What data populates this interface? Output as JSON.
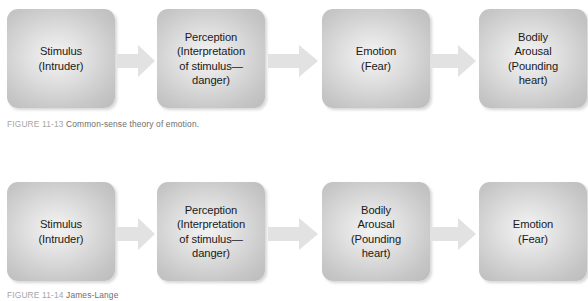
{
  "figures": [
    {
      "id": "common-sense-theory",
      "caption": {
        "tag": "FIGURE 11-13",
        "text": "Common-sense theory of emotion."
      },
      "nodes": [
        {
          "name": "stimulus",
          "label": "Stimulus\n(Intruder)"
        },
        {
          "name": "perception",
          "label": "Perception\n(Interpretation\nof stimulus—\ndanger)"
        },
        {
          "name": "emotion",
          "label": "Emotion\n(Fear)"
        },
        {
          "name": "bodily-arousal",
          "label": "Bodily\nArousal\n(Pounding\nheart)"
        }
      ],
      "arrow_icon": "right-arrow-icon",
      "arrow_count": 3
    },
    {
      "id": "james-lange-theory",
      "caption": {
        "tag": "FIGURE 11-14",
        "text": "James-Lange"
      },
      "nodes": [
        {
          "name": "stimulus",
          "label": "Stimulus\n(Intruder)"
        },
        {
          "name": "perception",
          "label": "Perception\n(Interpretation\nof stimulus—\ndanger)"
        },
        {
          "name": "bodily-arousal",
          "label": "Bodily\nArousal\n(Pounding\nheart)"
        },
        {
          "name": "emotion",
          "label": "Emotion\n(Fear)"
        }
      ],
      "arrow_icon": "right-arrow-icon",
      "arrow_count": 3
    }
  ],
  "colors": {
    "box_fill_center": "#ececec",
    "box_fill_edge": "#bfbfbf",
    "arrow_fill": "#e2e2e2",
    "text": "#1a1a1a",
    "caption_tag": "#a6a6a6",
    "caption_text": "#6e6e6e",
    "background": "#ffffff"
  }
}
